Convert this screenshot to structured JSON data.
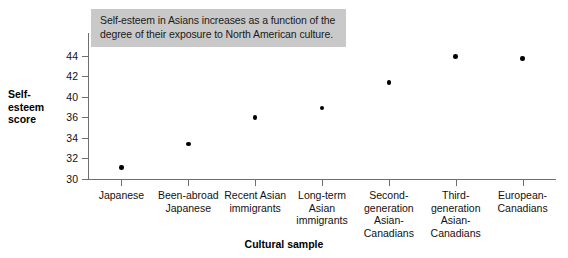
{
  "chart_data": {
    "type": "scatter",
    "title": "",
    "annotation": {
      "lines": [
        "Self-esteem in Asians increases as a function of the",
        "degree of their exposure to North American culture."
      ],
      "background_color": "#c9c9c9"
    },
    "xlabel": "Cultural sample",
    "ylabel": "Self-esteem score",
    "ylabel_lines": [
      "Self-",
      "esteem",
      "score"
    ],
    "ylim": [
      30,
      44
    ],
    "yticks": [
      30,
      32,
      34,
      36,
      40,
      42,
      44
    ],
    "ytick_labels": [
      "30",
      "32",
      "34",
      "36",
      "40",
      "42",
      "44"
    ],
    "ytick_positions": [
      30,
      32,
      34,
      36,
      38,
      40,
      42
    ],
    "grid": false,
    "legend": null,
    "marker_color": "#000000",
    "axis_color": "#6e6e6e",
    "categories": [
      "Japanese",
      "Been-abroad Japanese",
      "Recent Asian immigrants",
      "Long-term Asian immigrants",
      "Second-generation Asian-Canadians",
      "Third-generation Asian-Canadians",
      "European-Canadians"
    ],
    "category_label_lines": [
      [
        "Japanese"
      ],
      [
        "Been-abroad",
        "Japanese"
      ],
      [
        "Recent Asian",
        "immigrants"
      ],
      [
        "Long-term",
        "Asian",
        "immigrants"
      ],
      [
        "Second-",
        "generation",
        "Asian-",
        "Canadians"
      ],
      [
        "Third-",
        "generation",
        "Asian-",
        "Canadians"
      ],
      [
        "European-",
        "Canadians"
      ]
    ],
    "values": [
      31.1,
      33.4,
      36.0,
      36.9,
      39.4,
      41.9,
      41.7
    ]
  }
}
